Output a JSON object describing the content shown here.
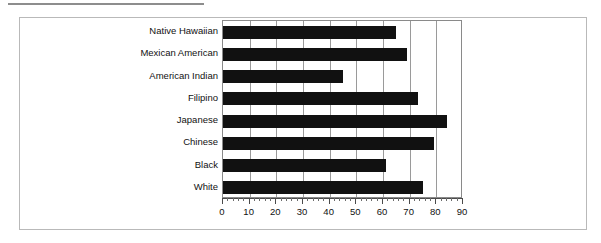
{
  "chart_data": {
    "type": "bar",
    "orientation": "horizontal",
    "title": "",
    "subtitle": "",
    "xlabel": "",
    "ylabel": "",
    "xlim": [
      0,
      90
    ],
    "xticks": [
      0,
      10,
      20,
      30,
      40,
      50,
      60,
      70,
      80,
      90
    ],
    "minor_tick_step": 2,
    "grid": "vertical",
    "legend": "none",
    "bar_color": "#111111",
    "categories": [
      "Native Hawaiian",
      "Mexican American",
      "American Indian",
      "Filipino",
      "Japanese",
      "Chinese",
      "Black",
      "White"
    ],
    "values": [
      65,
      69,
      45,
      73,
      84,
      79,
      61,
      75
    ],
    "annotations": []
  }
}
